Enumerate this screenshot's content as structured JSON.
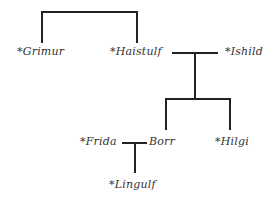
{
  "diagram": {
    "type": "family-tree",
    "line_color": "#222222",
    "text_color": "#333333",
    "people": [
      {
        "id": "grimur",
        "label": "*Grimur"
      },
      {
        "id": "haistulf",
        "label": "*Haistulf"
      },
      {
        "id": "ishild",
        "label": "*Ishild"
      },
      {
        "id": "frida",
        "label": "*Frida"
      },
      {
        "id": "borr",
        "label": "Borr"
      },
      {
        "id": "hilgi",
        "label": "*Hilgi"
      },
      {
        "id": "lingulf",
        "label": "*Lingulf"
      }
    ],
    "relations": [
      {
        "type": "siblings",
        "members": [
          "Grimur",
          "Haistulf"
        ]
      },
      {
        "type": "marriage",
        "members": [
          "Haistulf",
          "Ishild"
        ],
        "children": [
          "Borr",
          "Hilgi"
        ]
      },
      {
        "type": "marriage",
        "members": [
          "Frida",
          "Borr"
        ],
        "children": [
          "Lingulf"
        ]
      }
    ]
  }
}
